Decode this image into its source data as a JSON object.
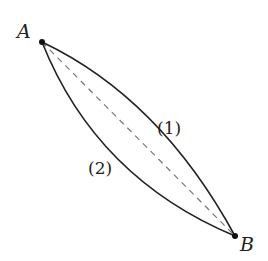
{
  "diagram": {
    "points": [
      {
        "id": "A",
        "label": "A",
        "x": 42,
        "y": 42
      },
      {
        "id": "B",
        "label": "B",
        "x": 235,
        "y": 236
      }
    ],
    "paths": [
      {
        "id": "path-1",
        "label": "(1)",
        "from": "A",
        "to": "B",
        "style": "solid",
        "bulge": "upper-right"
      },
      {
        "id": "path-2",
        "label": "(2)",
        "from": "A",
        "to": "B",
        "style": "solid",
        "bulge": "lower-left"
      },
      {
        "id": "chord",
        "from": "A",
        "to": "B",
        "style": "dashed"
      }
    ],
    "colors": {
      "curve": "#222222",
      "dashed": "#777777",
      "background": "#ffffff"
    }
  }
}
